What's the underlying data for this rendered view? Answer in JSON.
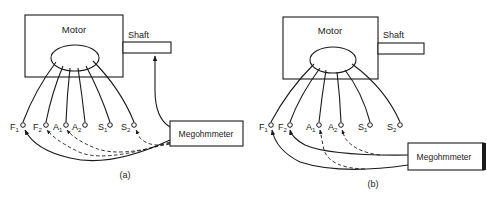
{
  "colors": {
    "ink": "#1a1a1a",
    "background": "#ffffff"
  },
  "panels": [
    {
      "id": "a",
      "caption": "(a)",
      "motor_label": "Motor",
      "shaft_label": "Shaft",
      "meter_label": "Megohmmeter",
      "terminals": [
        {
          "label": "F",
          "sub": "1"
        },
        {
          "label": "F",
          "sub": "2"
        },
        {
          "label": "A",
          "sub": "1"
        },
        {
          "label": "A",
          "sub": "2"
        },
        {
          "label": "S",
          "sub": "1"
        },
        {
          "label": "S",
          "sub": "2"
        }
      ],
      "description": "Megohmmeter connected between shaft and all terminals (F1 solid, F2/A1/S2 dashed)"
    },
    {
      "id": "b",
      "caption": "(b)",
      "motor_label": "Motor",
      "shaft_label": "Shaft",
      "meter_label": "Megohmmeter",
      "terminals": [
        {
          "label": "F",
          "sub": "1"
        },
        {
          "label": "F",
          "sub": "2"
        },
        {
          "label": "A",
          "sub": "1"
        },
        {
          "label": "A",
          "sub": "2"
        },
        {
          "label": "S",
          "sub": "1"
        },
        {
          "label": "S",
          "sub": "2"
        }
      ],
      "description": "Megohmmeter connected between field terminals (F1, F2 solid) and armature terminals (A1, A2 dashed)"
    }
  ]
}
